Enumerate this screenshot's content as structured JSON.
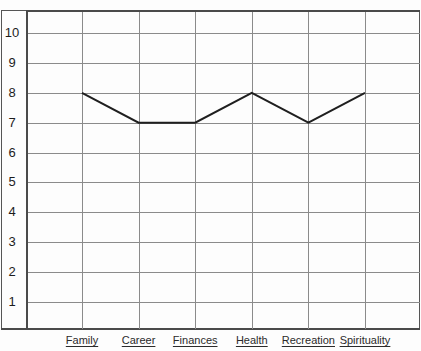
{
  "chart_data": {
    "type": "line",
    "title": "",
    "subtitle": "",
    "xlabel": "",
    "ylabel": "",
    "categories": [
      "Family",
      "Career",
      "Finances",
      "Health",
      "Recreation",
      "Spirituality"
    ],
    "values": [
      8,
      7,
      7,
      8,
      7,
      8
    ],
    "series": [
      {
        "name": "",
        "values": [
          8,
          7,
          7,
          8,
          7,
          8
        ]
      }
    ],
    "ylim": [
      0,
      11
    ],
    "ytick_labels": [
      "10",
      "9",
      "8",
      "7",
      "6",
      "5",
      "4",
      "3",
      "2",
      "1"
    ],
    "ytick_values": [
      10,
      9,
      8,
      7,
      6,
      5,
      4,
      3,
      2,
      1
    ],
    "grid": true,
    "legend": "none",
    "annotations": [],
    "colors": {
      "background": "#fdfdfd",
      "gridline": "#8b8b8b",
      "frame": "#4a4a4a",
      "series_line": "#1f1f1f",
      "label_text": "#2b2b2b",
      "tick_text": "#1c1c1c"
    }
  },
  "yaxis": {
    "ticks": [
      {
        "label": "10",
        "value": 10
      },
      {
        "label": "9",
        "value": 9
      },
      {
        "label": "8",
        "value": 8
      },
      {
        "label": "7",
        "value": 7
      },
      {
        "label": "6",
        "value": 6
      },
      {
        "label": "5",
        "value": 5
      },
      {
        "label": "4",
        "value": 4
      },
      {
        "label": "3",
        "value": 3
      },
      {
        "label": "2",
        "value": 2
      },
      {
        "label": "1",
        "value": 1
      }
    ]
  },
  "xaxis": {
    "categories": [
      {
        "label": "Family",
        "value": 8
      },
      {
        "label": "Career",
        "value": 7
      },
      {
        "label": "Finances",
        "value": 7
      },
      {
        "label": "Health",
        "value": 8
      },
      {
        "label": "Recreation",
        "value": 7
      },
      {
        "label": "Spirituality",
        "value": 8
      }
    ]
  }
}
